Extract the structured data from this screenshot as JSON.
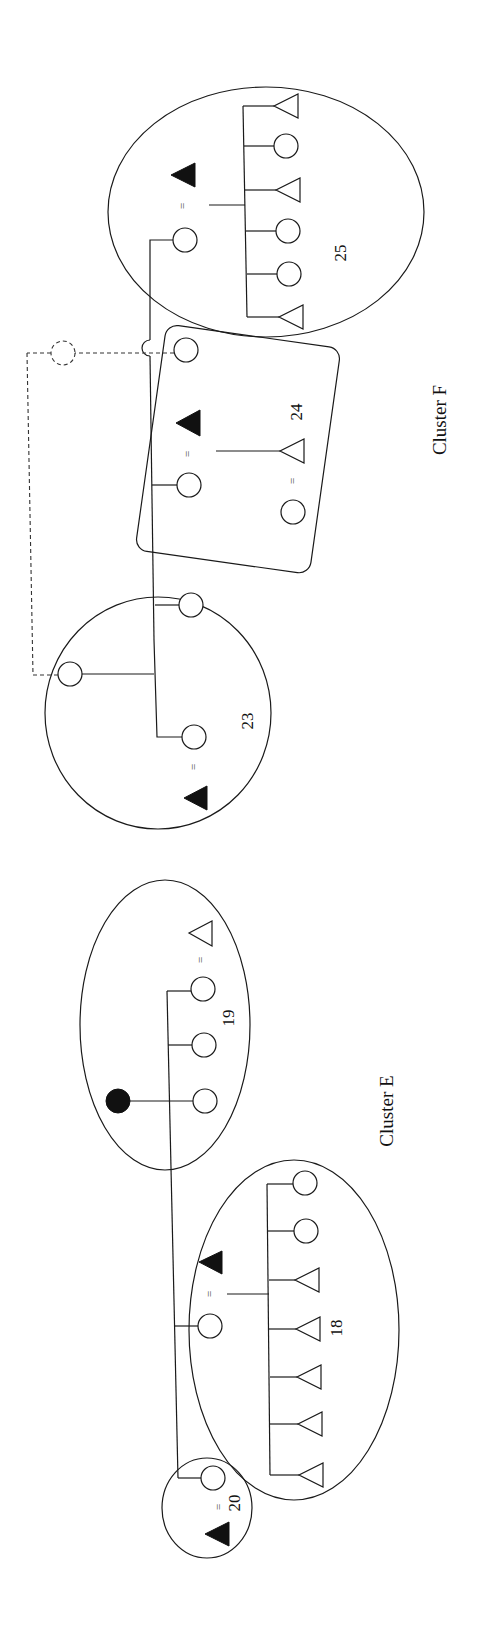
{
  "diagram": {
    "type": "kinship-cluster-diagram",
    "orientation": "rotated-90-clockwise",
    "clusters": [
      {
        "label": "Cluster E",
        "groups": [
          "18",
          "19",
          "20"
        ]
      },
      {
        "label": "Cluster F",
        "groups": [
          "23",
          "24",
          "25"
        ]
      }
    ],
    "labels": {
      "cluster_e": "Cluster E",
      "cluster_f": "Cluster F",
      "g18": "18",
      "g19": "19",
      "g20": "20",
      "g23": "23",
      "g24": "24",
      "g25": "25",
      "marriage": "="
    },
    "legend_symbols": {
      "circle": "female",
      "triangle": "male",
      "filled": "ego / deceased marker",
      "equals": "marriage",
      "dashed": "hypothetical link"
    },
    "colors": {
      "stroke": "#1a1a1a",
      "fill": "#111111",
      "background": "#ffffff"
    }
  }
}
